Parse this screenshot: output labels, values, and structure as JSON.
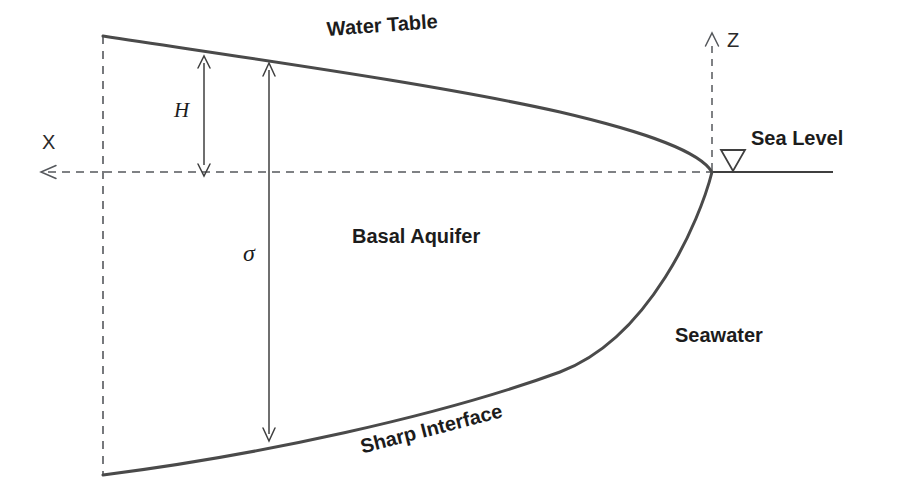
{
  "figure": {
    "type": "hydrogeology-cross-section-diagram",
    "background_color": "#ffffff",
    "line_color": "#3f3f3f",
    "text_color": "#1c1c1c",
    "width": 900,
    "height": 503
  },
  "labels": {
    "water_table": "Water Table",
    "sharp_interface": "Sharp Interface",
    "basal_aquifer": "Basal Aquifer",
    "seawater": "Seawater",
    "sea_level": "Sea Level",
    "z_axis": "Z",
    "x_axis": "X",
    "head_thickness": "H",
    "aquifer_thickness": "σ"
  },
  "annotations": {
    "sea_level_marker": "inverted-triangle",
    "z_axis_direction": "up",
    "x_axis_direction": "left",
    "head_arrow": "double-headed-vertical",
    "sigma_arrow": "double-headed-vertical"
  }
}
